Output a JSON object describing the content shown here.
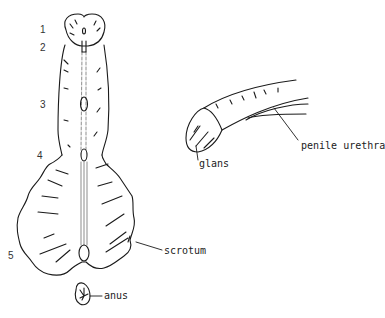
{
  "diagram": {
    "type": "anatomical line drawing",
    "left_figure": {
      "description": "ventral view of penis and scrotum with numbered positions along the midline",
      "position_numbers": [
        "1",
        "2",
        "3",
        "4",
        "5"
      ],
      "labels": {
        "scrotum": "scrotum",
        "anus": "anus"
      }
    },
    "right_figure": {
      "description": "lateral view of penis",
      "labels": {
        "glans": "glans",
        "penile_urethra": "penile urethra"
      }
    },
    "colors": {
      "line": "#1a1a1a",
      "background": "#ffffff"
    }
  }
}
